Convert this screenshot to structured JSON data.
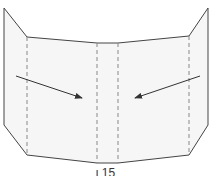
{
  "diagram": {
    "type": "folded-panel",
    "colors": {
      "outline": "#444444",
      "fill": "#f6f6f6",
      "fold_line": "#888888",
      "arrow": "#333333"
    },
    "outline_points": [
      [
        4,
        8
      ],
      [
        27,
        37
      ],
      [
        97,
        43
      ],
      [
        118,
        43
      ],
      [
        189,
        36
      ],
      [
        208,
        8
      ],
      [
        208,
        125
      ],
      [
        189,
        155
      ],
      [
        118,
        163
      ],
      [
        97,
        163
      ],
      [
        27,
        155
      ],
      [
        4,
        125
      ]
    ],
    "fold_lines_x": [
      27,
      97,
      118,
      189
    ],
    "arrows": [
      {
        "from": [
          16,
          76
        ],
        "to": [
          82,
          98
        ],
        "direction": "inward-right"
      },
      {
        "from": [
          200,
          76
        ],
        "to": [
          135,
          98
        ],
        "direction": "inward-left"
      }
    ]
  },
  "caption": "ι 15"
}
